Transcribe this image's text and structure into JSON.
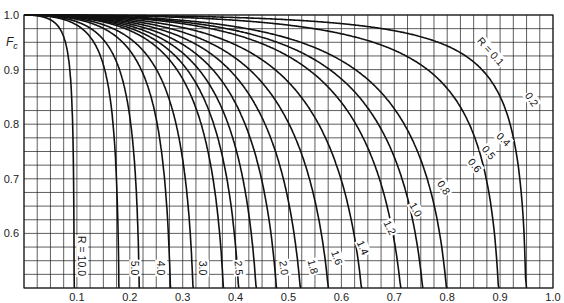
{
  "chart_data": {
    "type": "line",
    "title": "",
    "xlabel": "",
    "ylabel": "F_c",
    "xlim": [
      0,
      1.0
    ],
    "ylim": [
      0.5,
      1.0
    ],
    "grid": true,
    "grid_minor_step_x": 0.025,
    "grid_minor_step_y": 0.025,
    "x_ticks": [
      "0.1",
      "0.2",
      "0.3",
      "0.4",
      "0.5",
      "0.6",
      "0.7",
      "0.8",
      "0.9",
      "1.0"
    ],
    "y_ticks": [
      "1.0",
      "0.9",
      "0.8",
      "0.7",
      "0.6"
    ],
    "y_tick_values": [
      1.0,
      0.9,
      0.8,
      0.7,
      0.6
    ],
    "x_tick_values": [
      0.1,
      0.2,
      0.3,
      0.4,
      0.5,
      0.6,
      0.7,
      0.8,
      0.9,
      1.0
    ],
    "series": [
      {
        "name": "R = 0.1",
        "R": 0.1,
        "label": "R = 0.1",
        "label_pos": [
          490,
          52
        ],
        "label_rot": 48,
        "end": {
          "x": 1.0,
          "y": 0.835
        }
      },
      {
        "name": "0.2",
        "R": 0.2,
        "label": "0.2",
        "label_pos": [
          531,
          100
        ],
        "label_rot": 55,
        "end": {
          "x": 1.0,
          "y": 0.68
        }
      },
      {
        "name": "0.4",
        "R": 0.4,
        "label": "0.4",
        "label_pos": [
          503,
          140
        ],
        "label_rot": 45,
        "end": {
          "x": 0.99,
          "y": 0.5
        }
      },
      {
        "name": "0.5",
        "R": 0.5,
        "label": "0.5",
        "label_pos": [
          488,
          153
        ],
        "label_rot": 50,
        "end": {
          "x": 0.972,
          "y": 0.5
        }
      },
      {
        "name": "0.6",
        "R": 0.6,
        "label": "0.6",
        "label_pos": [
          474,
          166
        ],
        "label_rot": 52,
        "end": {
          "x": 0.945,
          "y": 0.5
        }
      },
      {
        "name": "0.8",
        "R": 0.8,
        "label": "0.8",
        "label_pos": [
          443,
          188
        ],
        "label_rot": 57,
        "end": {
          "x": 0.88,
          "y": 0.5
        }
      },
      {
        "name": "1.0",
        "R": 1.0,
        "label": "1.0",
        "label_pos": [
          415,
          210
        ],
        "label_rot": 60,
        "end": {
          "x": 0.8,
          "y": 0.5
        }
      },
      {
        "name": "1.2",
        "R": 1.2,
        "label": "1.2",
        "label_pos": [
          389,
          228
        ],
        "label_rot": 63,
        "end": {
          "x": 0.722,
          "y": 0.5
        }
      },
      {
        "name": "1.4",
        "R": 1.4,
        "label": "1.4",
        "label_pos": [
          362,
          248
        ],
        "label_rot": 66,
        "end": {
          "x": 0.652,
          "y": 0.5
        }
      },
      {
        "name": "1.6",
        "R": 1.6,
        "label": "1.6",
        "label_pos": [
          336,
          258
        ],
        "label_rot": 70,
        "end": {
          "x": 0.586,
          "y": 0.5
        }
      },
      {
        "name": "1.8",
        "R": 1.8,
        "label": "1.8",
        "label_pos": [
          312,
          267
        ],
        "label_rot": 75,
        "end": {
          "x": 0.535,
          "y": 0.5
        }
      },
      {
        "name": "2.0",
        "R": 2.0,
        "label": "2.0",
        "label_pos": [
          283,
          268
        ],
        "label_rot": 82,
        "end": {
          "x": 0.48,
          "y": 0.5
        }
      },
      {
        "name": "2.5",
        "R": 2.5,
        "label": "2.5",
        "label_pos": [
          238,
          268
        ],
        "label_rot": 85,
        "end": {
          "x": 0.4,
          "y": 0.5
        }
      },
      {
        "name": "3.0",
        "R": 3.0,
        "label": "3.0",
        "label_pos": [
          202,
          268
        ],
        "label_rot": 90,
        "end": {
          "x": 0.333,
          "y": 0.5
        }
      },
      {
        "name": "4.0",
        "R": 4.0,
        "label": "4.0",
        "label_pos": [
          160,
          268
        ],
        "label_rot": 90,
        "end": {
          "x": 0.25,
          "y": 0.5
        }
      },
      {
        "name": "5.0",
        "R": 5.0,
        "label": "5.0",
        "label_pos": [
          134,
          268
        ],
        "label_rot": 90,
        "end": {
          "x": 0.2,
          "y": 0.5
        }
      },
      {
        "name": "R = 10.0",
        "R": 10.0,
        "label": "R = 10.0",
        "label_pos": [
          81,
          256
        ],
        "label_rot": 90,
        "end": {
          "x": 0.1,
          "y": 0.5
        }
      }
    ]
  },
  "colors": {
    "grid": "#1a1a1a",
    "curve": "#111111",
    "background": "#ffffff"
  }
}
